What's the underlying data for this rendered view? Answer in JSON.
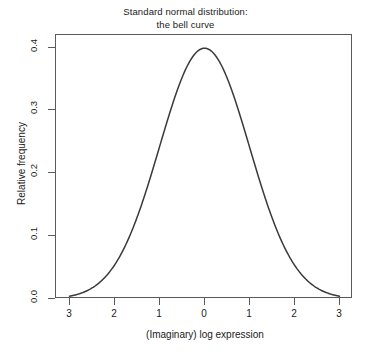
{
  "chart_data": {
    "type": "line",
    "title": "Standard normal distribution:\nthe bell curve",
    "title_line1": "Standard normal distribution:",
    "title_line2": "the bell curve",
    "xlabel": "(Imaginary) log expression",
    "ylabel": "Relative frequency",
    "xlim": [
      -3.3,
      3.3
    ],
    "ylim": [
      0.0,
      0.42
    ],
    "x_ticks": [
      -3,
      -2,
      -1,
      0,
      1,
      2,
      3
    ],
    "x_tick_labels": [
      "3",
      "2",
      "1",
      "0",
      "1",
      "2",
      "3"
    ],
    "y_ticks": [
      0.0,
      0.1,
      0.2,
      0.3,
      0.4
    ],
    "y_tick_labels": [
      "0.0",
      "0.1",
      "0.2",
      "0.3",
      "0.4"
    ],
    "grid": false,
    "legend": false,
    "frame": true,
    "line_color": "#3a3a3a",
    "line_width": 1.5,
    "background": "#ffffff",
    "series": [
      {
        "name": "standard normal density",
        "distribution": "normal",
        "mean": 0,
        "sd": 1,
        "x": [
          -3.0,
          -2.8,
          -2.6,
          -2.4,
          -2.2,
          -2.0,
          -1.8,
          -1.6,
          -1.4,
          -1.2,
          -1.0,
          -0.8,
          -0.6,
          -0.4,
          -0.2,
          0.0,
          0.2,
          0.4,
          0.6,
          0.8,
          1.0,
          1.2,
          1.4,
          1.6,
          1.8,
          2.0,
          2.2,
          2.4,
          2.6,
          2.8,
          3.0
        ],
        "values": [
          0.0044,
          0.0079,
          0.0136,
          0.0224,
          0.0355,
          0.054,
          0.079,
          0.1109,
          0.1497,
          0.1942,
          0.242,
          0.2897,
          0.3332,
          0.3683,
          0.391,
          0.3989,
          0.391,
          0.3683,
          0.3332,
          0.2897,
          0.242,
          0.1942,
          0.1497,
          0.1109,
          0.079,
          0.054,
          0.0355,
          0.0224,
          0.0136,
          0.0079,
          0.0044
        ]
      }
    ]
  }
}
